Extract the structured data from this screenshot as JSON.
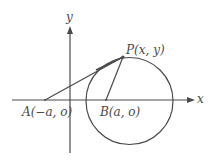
{
  "diagram": {
    "type": "geometry",
    "colors": {
      "stroke": "#4a4a4a",
      "text": "#4a4a4a",
      "background": "#ffffff"
    },
    "axes": {
      "x_label": "x",
      "y_label": "y"
    },
    "points": {
      "A": {
        "label": "A(−a, o)",
        "px": [
          45,
          100
        ]
      },
      "B": {
        "label": "B(a, o)",
        "px": [
          106,
          100
        ]
      },
      "P": {
        "label": "P(x, y)",
        "px": [
          123,
          57
        ]
      }
    },
    "circle": {
      "center_px": [
        129.5,
        101
      ],
      "radius_px": 43.5
    },
    "segments": [
      {
        "name": "tangent-AP",
        "from": "A",
        "to": "P"
      },
      {
        "name": "radius-BP",
        "from": "B",
        "to": "P"
      }
    ]
  }
}
